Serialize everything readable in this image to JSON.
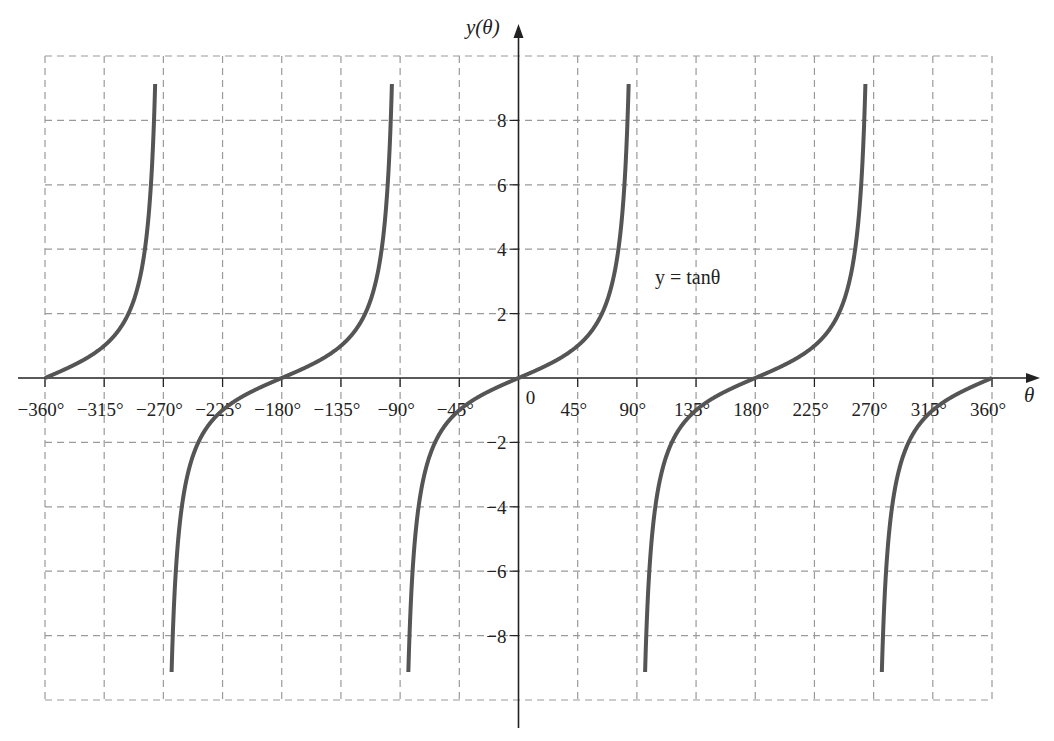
{
  "chart_data": {
    "type": "line",
    "title": "",
    "xlabel": "θ",
    "ylabel": "y(θ)",
    "annotation": "y = tanθ",
    "x_ticks": [
      "−360°",
      "−315°",
      "−270°",
      "−225°",
      "−180°",
      "−135°",
      "−90°",
      "−45°",
      "0",
      "45°",
      "90°",
      "135°",
      "180°",
      "225°",
      "270°",
      "315°",
      "360°"
    ],
    "x_tick_values": [
      -360,
      -315,
      -270,
      -225,
      -180,
      -135,
      -90,
      -45,
      0,
      45,
      90,
      135,
      180,
      225,
      270,
      315,
      360
    ],
    "y_ticks": [
      "8",
      "6",
      "4",
      "2",
      "−2",
      "−4",
      "−6",
      "−8"
    ],
    "y_tick_values": [
      8,
      6,
      4,
      2,
      -2,
      -4,
      -6,
      -8
    ],
    "xlim": [
      -360,
      360
    ],
    "ylim": [
      -10,
      10
    ],
    "grid": true,
    "grid_style": "dashed",
    "series": [
      {
        "name": "y = tanθ",
        "function": "tan",
        "x_start": -360,
        "x_end": 360,
        "asymptotes": [
          -270,
          -90,
          90,
          270
        ],
        "clip_y": [
          -9.5,
          9.5
        ],
        "sample_points": [
          [
            -360,
            0
          ],
          [
            -315,
            1
          ],
          [
            -180,
            0
          ],
          [
            -135,
            1
          ],
          [
            -45,
            -1
          ],
          [
            0,
            0
          ],
          [
            45,
            1
          ],
          [
            135,
            -1
          ],
          [
            180,
            0
          ],
          [
            225,
            1
          ],
          [
            315,
            -1
          ],
          [
            360,
            0
          ]
        ]
      }
    ],
    "legend": "none"
  },
  "labels": {
    "x_axis": "θ",
    "y_axis": "y(θ)",
    "function": "y = tanθ",
    "origin": "0"
  },
  "colors": {
    "curve": "#555555",
    "grid": "#9a9a9a",
    "axis": "#222222"
  }
}
